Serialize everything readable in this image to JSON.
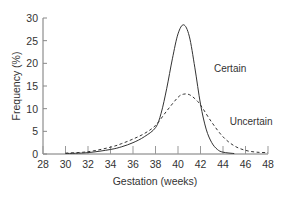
{
  "chart_data": {
    "type": "line",
    "title": "",
    "xlabel": "Gestation (weeks)",
    "ylabel": "Frequency (%)",
    "xlim": [
      28,
      48
    ],
    "ylim": [
      0,
      30
    ],
    "xticks": [
      28,
      30,
      32,
      34,
      36,
      38,
      40,
      42,
      44,
      46,
      48
    ],
    "yticks": [
      0,
      5,
      10,
      15,
      20,
      25,
      30
    ],
    "grid": false,
    "legend": "inline labels",
    "series": [
      {
        "name": "Certain",
        "style": "solid",
        "x": [
          30,
          32,
          34,
          35,
          36,
          37,
          38,
          38.5,
          39,
          39.5,
          40,
          40.5,
          41,
          41.5,
          42,
          42.5,
          43,
          43.5,
          44,
          45
        ],
        "y": [
          0.1,
          0.3,
          1.0,
          1.6,
          2.5,
          3.8,
          5.8,
          9.0,
          14.5,
          21.0,
          26.5,
          28.5,
          26.0,
          19.0,
          11.0,
          5.5,
          2.5,
          1.0,
          0.4,
          0.1
        ]
      },
      {
        "name": "Uncertain",
        "style": "dashed",
        "x": [
          30,
          32,
          34,
          35,
          36,
          37,
          38,
          39,
          40,
          40.5,
          41,
          41.5,
          42,
          43,
          44,
          45,
          46,
          47,
          48
        ],
        "y": [
          0.2,
          0.5,
          1.5,
          2.3,
          3.3,
          4.5,
          6.3,
          9.5,
          12.5,
          13.2,
          13.1,
          12.2,
          10.8,
          7.0,
          3.8,
          1.8,
          0.8,
          0.4,
          0.3
        ]
      }
    ],
    "annotations": [
      {
        "text": "Certain",
        "x": 43.2,
        "y": 18
      },
      {
        "text": "Uncertain",
        "x": 44.6,
        "y": 6.5
      }
    ]
  }
}
